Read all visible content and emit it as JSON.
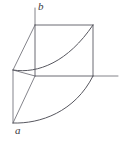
{
  "figure": {
    "type": "line-diagram",
    "width": 121,
    "height": 141,
    "background_color": "#ffffff",
    "stroke_color": "#5a5a62",
    "labels": [
      {
        "id": "a",
        "text": "a",
        "x": 15,
        "y": 125,
        "style": "italic"
      },
      {
        "id": "b",
        "text": "b",
        "x": 38,
        "y": 1,
        "style": "italic"
      }
    ],
    "points": {
      "b_corner": {
        "x": 35,
        "y": 25
      },
      "top_right": {
        "x": 93,
        "y": 25
      },
      "center_node": {
        "x": 35,
        "y": 76
      },
      "right_node": {
        "x": 93,
        "y": 76
      },
      "left_node": {
        "x": 13,
        "y": 70
      },
      "a_point": {
        "x": 13,
        "y": 123
      },
      "axis_end": {
        "x": 118,
        "y": 76
      },
      "b_tick_top": {
        "x": 35,
        "y": 8
      }
    },
    "elements": [
      {
        "name": "vertical-axis-stub",
        "kind": "line",
        "from": "b_tick_top",
        "to": "b_corner"
      },
      {
        "name": "square-top-edge",
        "kind": "line",
        "from": "b_corner",
        "to": "top_right"
      },
      {
        "name": "square-left-edge",
        "kind": "line",
        "from": "b_corner",
        "to": "center_node"
      },
      {
        "name": "square-right-edge",
        "kind": "line",
        "from": "top_right",
        "to": "right_node"
      },
      {
        "name": "square-bottom-edge",
        "kind": "line",
        "from": "center_node",
        "to": "right_node"
      },
      {
        "name": "horizontal-axis",
        "kind": "line",
        "from": "right_node",
        "to": "axis_end"
      },
      {
        "name": "left-face-top-edge",
        "kind": "line",
        "from": "left_node",
        "to": "center_node"
      },
      {
        "name": "left-face-vertical-edge",
        "kind": "line",
        "from": "left_node",
        "to": "a_point"
      },
      {
        "name": "left-face-diagonal-edge",
        "kind": "line",
        "from": "a_point",
        "to": "center_node"
      },
      {
        "name": "ridge-edge-to-b",
        "kind": "line",
        "from": "left_node",
        "to": "b_corner"
      },
      {
        "name": "upper-curve",
        "kind": "curve",
        "from": "left_node",
        "to": "top_right"
      },
      {
        "name": "lower-curve",
        "kind": "curve",
        "from": "a_point",
        "to": "right_node"
      }
    ],
    "colors": {
      "ink": "#5a5a62",
      "curve": "#57575f",
      "axis": "#77777e",
      "paper": "#ffffff"
    }
  }
}
